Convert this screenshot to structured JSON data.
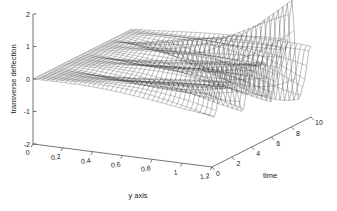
{
  "figure": {
    "type": "matlab-3d-mesh-figure",
    "background_color": "#ffffff",
    "line_color": "#2a2a2a"
  },
  "chart_data": {
    "type": "surface",
    "title": "",
    "subtitle": "",
    "xlabel": "y axis",
    "ylabel": "time",
    "zlabel": "transverse deflection",
    "grid": false,
    "legend": "none",
    "projection": "3d-mesh",
    "xlim": [
      0,
      1.2
    ],
    "ylim": [
      0,
      10
    ],
    "zlim": [
      -2,
      2
    ],
    "x_ticks": [
      "0",
      "0.2",
      "0.4",
      "0.6",
      "0.8",
      "1",
      "1.2"
    ],
    "x_tick_values": [
      0,
      0.2,
      0.4,
      0.6,
      0.8,
      1,
      1.2
    ],
    "y_ticks": [
      "0",
      "2",
      "4",
      "6",
      "8",
      "10"
    ],
    "y_tick_values": [
      0,
      2,
      4,
      6,
      8,
      10
    ],
    "z_ticks": [
      "2",
      "1",
      "0",
      "-1",
      "-2"
    ],
    "z_tick_values": [
      2,
      1,
      0,
      -1,
      -2
    ],
    "view_azimuth": -37.5,
    "view_elevation": 30,
    "mesh_nx": 40,
    "mesh_ny": 48,
    "amplitude_peak": 2.0,
    "amplitude_trough": -1.3
  },
  "axes": {
    "z_axis_name": "transverse deflection",
    "x_axis_name": "y axis",
    "y_axis_name": "time"
  }
}
